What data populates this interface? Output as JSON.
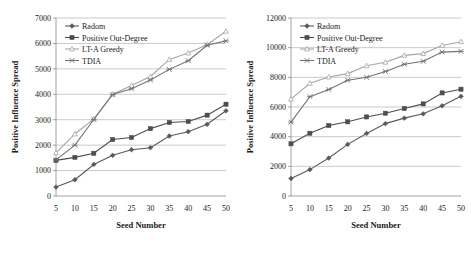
{
  "figure": {
    "background_color": "#ffffff",
    "panel_count": 2
  },
  "charts": [
    {
      "id": "left-chart",
      "title": "",
      "xlabel": "Seed Number",
      "ylabel": "Positive Influence Spread",
      "xticks": [
        "5",
        "10",
        "15",
        "20",
        "25",
        "30",
        "35",
        "40",
        "45",
        "50"
      ],
      "yticks": [
        "0",
        "1000",
        "2000",
        "3000",
        "4000",
        "5000",
        "6000",
        "7000"
      ],
      "legend": [
        {
          "label": "Radom",
          "marker": "diamond",
          "color": "#595959"
        },
        {
          "label": "Positive Out-Degree",
          "marker": "square",
          "color": "#4d4d4d"
        },
        {
          "label": "LT-A Greedy",
          "marker": "triangle",
          "color": "#a6a6a6"
        },
        {
          "label": "TDIA",
          "marker": "cross",
          "color": "#737373"
        }
      ]
    },
    {
      "id": "right-chart",
      "title": "",
      "xlabel": "Seed Number",
      "ylabel": "Positive Influence Spread",
      "xticks": [
        "5",
        "10",
        "15",
        "20",
        "25",
        "30",
        "35",
        "40",
        "45",
        "50"
      ],
      "yticks": [
        "0",
        "2000",
        "4000",
        "6000",
        "8000",
        "10000",
        "12000"
      ],
      "legend": [
        {
          "label": "Radom",
          "marker": "diamond",
          "color": "#595959"
        },
        {
          "label": "Positive Out-Degree",
          "marker": "square",
          "color": "#4d4d4d"
        },
        {
          "label": "LT-A Greedy",
          "marker": "triangle",
          "color": "#a6a6a6"
        },
        {
          "label": "TDIA",
          "marker": "cross",
          "color": "#737373"
        }
      ]
    }
  ],
  "chart_data": [
    {
      "type": "line",
      "id": "left-chart",
      "title": "",
      "xlabel": "Seed Number",
      "ylabel": "Positive Influence Spread",
      "x": [
        5,
        10,
        15,
        20,
        25,
        30,
        35,
        40,
        45,
        50
      ],
      "xlim": [
        5,
        50
      ],
      "ylim": [
        0,
        7000
      ],
      "ytick_step": 1000,
      "grid": true,
      "legend_position": "upper-left",
      "series": [
        {
          "name": "Radom",
          "marker": "diamond",
          "color": "#595959",
          "values": [
            350,
            640,
            1240,
            1600,
            1820,
            1900,
            2360,
            2530,
            2820,
            3350
          ]
        },
        {
          "name": "Positive Out-Degree",
          "marker": "square",
          "color": "#4d4d4d",
          "values": [
            1400,
            1520,
            1680,
            2220,
            2300,
            2650,
            2890,
            2930,
            3180,
            3610
          ]
        },
        {
          "name": "LT-A Greedy",
          "marker": "triangle",
          "color": "#a6a6a6",
          "values": [
            1700,
            2440,
            3030,
            4000,
            4350,
            4700,
            5370,
            5620,
            5950,
            6480
          ]
        },
        {
          "name": "TDIA",
          "marker": "cross",
          "color": "#737373",
          "values": [
            1420,
            2000,
            3010,
            3990,
            4220,
            4560,
            4980,
            5320,
            5930,
            6100
          ]
        }
      ]
    },
    {
      "type": "line",
      "id": "right-chart",
      "title": "",
      "xlabel": "Seed Number",
      "ylabel": "Positive Influence Spread",
      "x": [
        5,
        10,
        15,
        20,
        25,
        30,
        35,
        40,
        45,
        50
      ],
      "xlim": [
        5,
        50
      ],
      "ylim": [
        0,
        12000
      ],
      "ytick_step": 2000,
      "grid": true,
      "legend_position": "upper-left",
      "series": [
        {
          "name": "Radom",
          "marker": "diamond",
          "color": "#595959",
          "values": [
            1180,
            1780,
            2560,
            3480,
            4220,
            4880,
            5250,
            5540,
            6080,
            6720
          ]
        },
        {
          "name": "Positive Out-Degree",
          "marker": "square",
          "color": "#4d4d4d",
          "values": [
            3520,
            4230,
            4750,
            5000,
            5330,
            5580,
            5900,
            6210,
            6950,
            7200
          ]
        },
        {
          "name": "LT-A Greedy",
          "marker": "triangle",
          "color": "#a6a6a6",
          "values": [
            6530,
            7600,
            8020,
            8250,
            8780,
            9020,
            9480,
            9600,
            10150,
            10400
          ]
        },
        {
          "name": "TDIA",
          "marker": "cross",
          "color": "#737373",
          "values": [
            4980,
            6700,
            7180,
            7800,
            8000,
            8400,
            8880,
            9080,
            9700,
            9750
          ]
        }
      ]
    }
  ]
}
